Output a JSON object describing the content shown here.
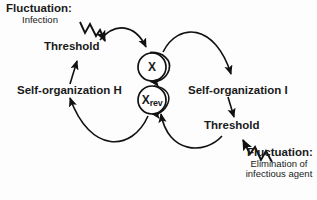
{
  "diagram": {
    "background_color": "#fdfdfd",
    "stroke_color": "#111111",
    "nodes": [
      {
        "id": "x",
        "label": "X",
        "shape": "circle",
        "cx": 152,
        "cy": 67,
        "r": 14
      },
      {
        "id": "xrev",
        "label": "X",
        "sublabel": "rev",
        "shape": "circle",
        "cx": 152,
        "cy": 100,
        "r": 14
      }
    ],
    "labels": {
      "fluctuation_top_title": "Fluctuation:",
      "fluctuation_top_detail": "Infection",
      "threshold_left": "Threshold",
      "self_organization_h": "Self-organization H",
      "self_organization_i": "Self-organization I",
      "threshold_right": "Threshold",
      "fluctuation_bottom_title": "Fluctuation:",
      "fluctuation_bottom_detail": "Elimination of infectious agent"
    },
    "node_labels": {
      "x_main": "X",
      "xrev_main": "X",
      "xrev_sub": "rev"
    },
    "edges": [
      {
        "id": "fluct-top-zigzag",
        "from": "Fluctuation: Infection",
        "to": "Threshold (left)",
        "style": "zigzag",
        "arrow": true
      },
      {
        "id": "selforg-h-to-threshold",
        "from": "Self-organization H",
        "to": "Threshold (left)",
        "style": "straight",
        "arrow": true
      },
      {
        "id": "threshold-to-x",
        "from": "Threshold (left)",
        "to": "X",
        "style": "arc",
        "arrow": true
      },
      {
        "id": "x-to-selforg-i",
        "from": "X",
        "to": "Self-organization I",
        "style": "arc",
        "arrow": true
      },
      {
        "id": "selforg-i-to-threshold",
        "from": "Self-organization I",
        "to": "Threshold (right)",
        "style": "straight",
        "arrow": true
      },
      {
        "id": "fluct-bottom-zigzag",
        "from": "Fluctuation: Elimination of infectious agent",
        "to": "Threshold (right)",
        "style": "zigzag",
        "arrow": true
      },
      {
        "id": "threshold-to-xrev",
        "from": "Threshold (right)",
        "to": "Xrev",
        "style": "arc",
        "arrow": true
      },
      {
        "id": "xrev-to-selforg-h",
        "from": "Xrev",
        "to": "Self-organization H",
        "style": "arc",
        "arrow": true
      },
      {
        "id": "x-self-loop",
        "from": "X",
        "to": "X",
        "style": "self-loop",
        "arrow": true
      },
      {
        "id": "xrev-self-loop",
        "from": "Xrev",
        "to": "Xrev",
        "style": "self-loop",
        "arrow": true
      }
    ]
  }
}
